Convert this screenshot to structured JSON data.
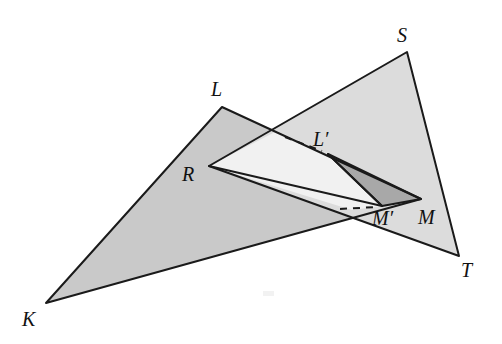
{
  "figure": {
    "background_color": "#ffffff",
    "stroke_color": "#1a1a1a",
    "fill_triangle_klm": "#c9c9c9",
    "fill_triangle_rst": "#dcdcdc",
    "fill_overlap_white": "#f1f1f1",
    "fill_sliver": "#a8a8a8",
    "dash_pattern": "7 6"
  },
  "labels": {
    "K": {
      "text": "K",
      "x": 22,
      "y": 326
    },
    "L": {
      "text": "L",
      "x": 211,
      "y": 96
    },
    "M": {
      "text": "M",
      "x": 418,
      "y": 224
    },
    "R": {
      "text": "R",
      "x": 182,
      "y": 181
    },
    "S": {
      "text": "S",
      "x": 397,
      "y": 42
    },
    "T": {
      "text": "T",
      "x": 461,
      "y": 277
    },
    "Lprime": {
      "text": "L′",
      "x": 313,
      "y": 146
    },
    "Mprime": {
      "text": "M′",
      "x": 372,
      "y": 225
    }
  },
  "points": {
    "K": {
      "x": 46,
      "y": 303
    },
    "L": {
      "x": 222,
      "y": 107
    },
    "M": {
      "x": 421,
      "y": 199
    },
    "R": {
      "x": 209,
      "y": 166
    },
    "S": {
      "x": 407,
      "y": 52
    },
    "T": {
      "x": 459,
      "y": 256
    },
    "Lprime": {
      "x": 328,
      "y": 154
    },
    "Mprime": {
      "x": 382,
      "y": 206
    },
    "KL_RS_intersection": {
      "x": 277,
      "y": 131
    },
    "KM_RM_intersection": {
      "x": 352,
      "y": 210
    }
  },
  "shapes": {
    "triangle_klm": "46,303 222,107 421,199",
    "triangle_rst": "209,166 407,52 459,256",
    "triangle_sliver": "328,154 421,199 382,206",
    "overlap_region": "209,166 277,131 421,199 382,206 352,210"
  },
  "segments": {
    "dashed_to_lprime": {
      "x1": 285,
      "y1": 137,
      "x2": 322,
      "y2": 151
    },
    "dashed_to_mprime": {
      "x1": 340,
      "y1": 209,
      "x2": 376,
      "y2": 207
    },
    "r_to_mprime": {
      "x1": 209,
      "y1": 166,
      "x2": 382,
      "y2": 206
    },
    "lprime_to_mprime": {
      "x1": 328,
      "y1": 154,
      "x2": 382,
      "y2": 206
    }
  },
  "artifact": {
    "x": 263,
    "y": 291,
    "width": 11,
    "height": 5,
    "color": "#f2f2f2"
  }
}
